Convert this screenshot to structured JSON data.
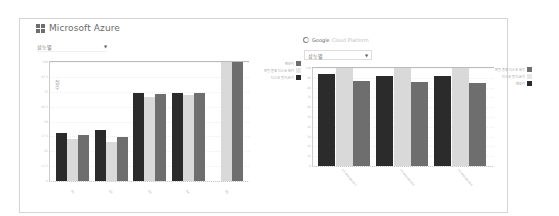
{
  "azure_panel": {
    "title": "Microsoft Azure",
    "logo_icon": "windows-logo-icon",
    "dropdown": {
      "selected": "성능별",
      "arrow": "▼"
    }
  },
  "gcp_panel": {
    "title": "Google",
    "subtitle": "Cloud Platform",
    "logo_icon": "google-cloud-logo-icon",
    "dropdown": {
      "selected": "성능별",
      "arrow": "▼"
    }
  },
  "colors": {
    "series_dark": "#2b2b2b",
    "series_light": "#d9d9d9",
    "series_mid": "#6e6e6e"
  },
  "chart_data": [
    {
      "type": "bar",
      "title": "Microsoft Azure",
      "ylabel": "점수",
      "xlabel": "",
      "categories": [
        "A1",
        "A2",
        "A3",
        "A4",
        "A5"
      ],
      "ylim": [
        0,
        100
      ],
      "yticks": [
        "0",
        "12.5",
        "25",
        "37.5",
        "50",
        "62.5",
        "75",
        "87.5",
        "100"
      ],
      "series": [
        {
          "name": "디스크 읽기/쓰기",
          "color": "#2b2b2b",
          "values": [
            40,
            43,
            74,
            74,
            null
          ]
        },
        {
          "name": "파일·환경·디스크 처리",
          "color": "#d9d9d9",
          "values": [
            35,
            33,
            71,
            72,
            100
          ]
        },
        {
          "name": "메모리",
          "color": "#6e6e6e",
          "values": [
            39,
            37,
            73,
            74,
            100
          ]
        }
      ],
      "legend_position": "right-top",
      "grid": true
    },
    {
      "type": "bar",
      "title": "Google Cloud Platform",
      "ylabel": "점수",
      "xlabel": "",
      "categories": [
        "n1-standard-1",
        "n1-standard-2",
        "n1-standard-4"
      ],
      "ylim": [
        0,
        100
      ],
      "yticks": [
        "0",
        "10",
        "20",
        "30",
        "40",
        "50",
        "60",
        "70",
        "80",
        "90",
        "100"
      ],
      "series": [
        {
          "name": "메모리",
          "color": "#2b2b2b",
          "values": [
            94,
            92,
            92
          ]
        },
        {
          "name": "디스크 읽기/쓰기",
          "color": "#d9d9d9",
          "values": [
            100,
            100,
            100
          ]
        },
        {
          "name": "파일·환경·디스크 처리",
          "color": "#6e6e6e",
          "values": [
            87,
            86,
            85
          ]
        }
      ],
      "legend_position": "right-top",
      "grid": true
    }
  ],
  "legends": {
    "azure": [
      {
        "label": "메모리",
        "color": "#6e6e6e"
      },
      {
        "label": "파일·환경·디스크 처리",
        "color": "#e6e6e6"
      },
      {
        "label": "디스크 읽기/쓰기",
        "color": "#2b2b2b"
      }
    ],
    "gcp": [
      {
        "label": "파일·환경·디스크 처리",
        "color": "#6e6e6e"
      },
      {
        "label": "디스크 읽기/쓰기",
        "color": "#e6e6e6"
      },
      {
        "label": "메모리",
        "color": "#2b2b2b"
      }
    ]
  }
}
